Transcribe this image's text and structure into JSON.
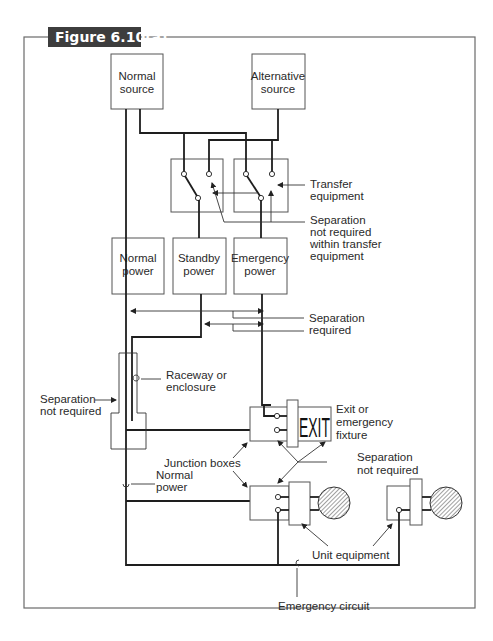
{
  "figure": {
    "title": "Figure 6.10(a)",
    "colors": {
      "title_bg": "#3d3d3d",
      "title_text": "#ffffff",
      "frame": "#6a6a6a",
      "wire": "#1e1e1e"
    }
  },
  "boxes": {
    "normal_source": [
      "Normal",
      "source"
    ],
    "alternative_source": [
      "Alternative",
      "source"
    ],
    "normal_power": [
      "Normal",
      "power"
    ],
    "standby_power": [
      "Standby",
      "power"
    ],
    "emergency_power": [
      "Emergency",
      "power"
    ]
  },
  "fixture": {
    "exit_sign": "EXIT"
  },
  "callouts": {
    "transfer_equipment": [
      "Transfer",
      "equipment"
    ],
    "separation_not_required_transfer": [
      "Separation",
      "not required",
      "within transfer",
      "equipment"
    ],
    "separation_required": [
      "Separation",
      "required"
    ],
    "raceway": [
      "Raceway or",
      "enclosure"
    ],
    "separation_not_required_left": [
      "Separation",
      "not required"
    ],
    "exit_fixture": [
      "Exit or",
      "emergency",
      "fixture"
    ],
    "junction_boxes": "Junction boxes",
    "separation_not_required_right": [
      "Separation",
      "not required"
    ],
    "normal_power_wire": [
      "Normal",
      "power"
    ],
    "unit_equipment": "Unit equipment",
    "emergency_circuit": "Emergency circuit"
  }
}
